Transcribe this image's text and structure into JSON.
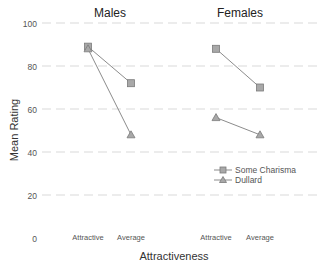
{
  "chart_data": {
    "type": "line",
    "title": "",
    "panels": [
      {
        "title": "Males",
        "categories": [
          "Attractive",
          "Average"
        ],
        "series": [
          {
            "name": "Some Charisma",
            "marker": "square",
            "values": [
              89,
              72
            ]
          },
          {
            "name": "Dullard",
            "marker": "triangle",
            "values": [
              88,
              48
            ]
          }
        ]
      },
      {
        "title": "Females",
        "categories": [
          "Attractive",
          "Average"
        ],
        "series": [
          {
            "name": "Some Charisma",
            "marker": "square",
            "values": [
              88,
              70
            ]
          },
          {
            "name": "Dullard",
            "marker": "triangle",
            "values": [
              56,
              48
            ]
          }
        ]
      }
    ],
    "xlabel": "Attractiveness",
    "ylabel": "Mean Rating",
    "ylim": [
      0,
      100
    ],
    "yticks": [
      0,
      20,
      40,
      60,
      80,
      100
    ],
    "grid": true,
    "legend": {
      "position": "inside-bottom-right",
      "entries": [
        "Some Charisma",
        "Dullard"
      ]
    }
  },
  "colors": {
    "line": "#8c8c8c",
    "marker_fill": "#a8a8a8",
    "marker_stroke": "#7a7a7a",
    "grid": "#d9d9d9",
    "text": "#333333",
    "tick_text": "#555555"
  }
}
